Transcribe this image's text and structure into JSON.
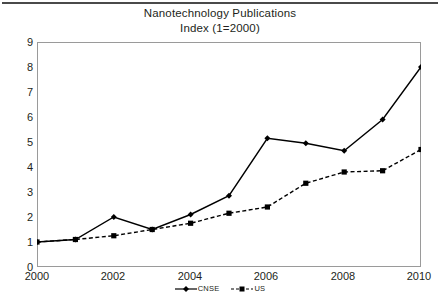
{
  "chart_data": {
    "type": "line",
    "title": "Nanotechnology Publications",
    "subtitle": "Index (1=2000)",
    "xlabel": "",
    "ylabel": "",
    "x": [
      2000,
      2001,
      2002,
      2003,
      2004,
      2005,
      2006,
      2007,
      2008,
      2009,
      2010
    ],
    "xtick_labels": [
      "2000",
      "2002",
      "2004",
      "2006",
      "2008",
      "2010"
    ],
    "xtick_values": [
      2000,
      2002,
      2004,
      2006,
      2008,
      2010
    ],
    "ytick_labels": [
      "0",
      "1",
      "2",
      "3",
      "4",
      "5",
      "6",
      "7",
      "8",
      "9"
    ],
    "ytick_values": [
      0,
      1,
      2,
      3,
      4,
      5,
      6,
      7,
      8,
      9
    ],
    "xlim": [
      2000,
      2010
    ],
    "ylim": [
      0,
      9
    ],
    "grid": false,
    "legend_position": "bottom",
    "series": [
      {
        "name": "CNSE",
        "style": "solid",
        "marker": "diamond",
        "color": "#000000",
        "values": [
          1.0,
          1.1,
          2.0,
          1.5,
          2.1,
          2.85,
          5.15,
          4.95,
          4.65,
          5.9,
          8.0
        ]
      },
      {
        "name": "US",
        "style": "dashed",
        "marker": "square",
        "color": "#000000",
        "values": [
          1.0,
          1.1,
          1.25,
          1.5,
          1.75,
          2.15,
          2.4,
          3.35,
          3.8,
          3.85,
          4.7
        ]
      }
    ]
  },
  "legend": {
    "items": [
      {
        "label": "CNSE"
      },
      {
        "label": "US"
      }
    ]
  },
  "axis": {
    "y_labels": [
      "9",
      "8",
      "7",
      "6",
      "5",
      "4",
      "3",
      "2",
      "1",
      "0"
    ],
    "x_labels": [
      "2000",
      "2002",
      "2004",
      "2006",
      "2008",
      "2010"
    ]
  }
}
